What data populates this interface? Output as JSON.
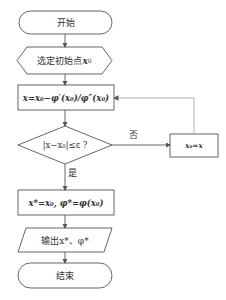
{
  "diagram": {
    "type": "flowchart",
    "nodes": {
      "start": {
        "shape": "terminal",
        "label": "开始"
      },
      "init": {
        "shape": "hexagon",
        "label_prefix": "选定初始点",
        "label_var": "x",
        "label_sub": "0"
      },
      "update": {
        "shape": "process",
        "label": "x=x₀−φ′(x₀)/φ″(x₀)"
      },
      "check": {
        "shape": "decision",
        "label": "|x−x₀|≤ε ?"
      },
      "assign": {
        "shape": "process",
        "label": "x₀=x"
      },
      "result": {
        "shape": "process",
        "label": "x*=x₀, φ*=φ(x₀)"
      },
      "output": {
        "shape": "parallelogram",
        "label": "输出x*、φ*"
      },
      "end": {
        "shape": "terminal",
        "label": "结束"
      }
    },
    "edges": {
      "yes_label": "是",
      "no_label": "否"
    },
    "colors": {
      "stroke": "#555555",
      "text": "#333333",
      "background": "#ffffff"
    }
  }
}
